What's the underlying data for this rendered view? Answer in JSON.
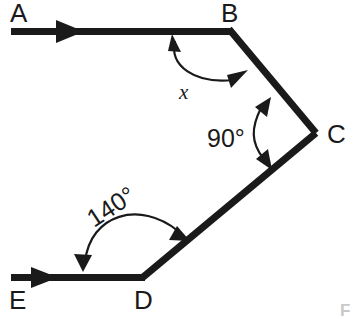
{
  "diagram": {
    "type": "geometry-angle-diagram",
    "background_color": "#ffffff",
    "ink_color": "#1a1a1a",
    "vertices": [
      {
        "id": "A",
        "label": "A",
        "x": 11,
        "y": 31,
        "label_x": 10,
        "label_y": 22
      },
      {
        "id": "B",
        "label": "B",
        "x": 230,
        "y": 31,
        "label_x": 222,
        "label_y": 22
      },
      {
        "id": "C",
        "label": "C",
        "x": 315,
        "y": 133,
        "label_x": 327,
        "label_y": 143
      },
      {
        "id": "D",
        "label": "D",
        "x": 143,
        "y": 277,
        "label_x": 134,
        "label_y": 307
      },
      {
        "id": "E",
        "label": "E",
        "x": 11,
        "y": 277,
        "label_x": 10,
        "label_y": 307
      }
    ],
    "segments": [
      {
        "name": "ray-AB",
        "from": "A",
        "to": "B"
      },
      {
        "name": "segment-BC",
        "from": "B",
        "to": "C"
      },
      {
        "name": "segment-CD",
        "from": "C",
        "to": "D"
      },
      {
        "name": "ray-ED",
        "from": "E",
        "to": "D"
      }
    ],
    "direction_arrows": [
      {
        "name": "arrow-on-AB",
        "x": 72,
        "y": 31,
        "direction": "right"
      },
      {
        "name": "arrow-on-ED",
        "x": 46,
        "y": 277,
        "direction": "right"
      }
    ],
    "angles": [
      {
        "id": "angle-x",
        "label": "x",
        "vertex": "B",
        "label_x": 180,
        "label_y": 98,
        "value_known": false,
        "arc_double_headed": true
      },
      {
        "id": "angle-90",
        "label": "90°",
        "vertex": "C",
        "label_x": 209,
        "label_y": 147,
        "value_known": true,
        "value": 90,
        "arc_double_headed": true
      },
      {
        "id": "angle-140",
        "label": "140°",
        "vertex": "D",
        "label_x": 94,
        "label_y": 228,
        "label_rotation": -33,
        "value_known": true,
        "value": 140,
        "arc_double_headed": true
      }
    ],
    "corner_mark": {
      "label": "F",
      "x": 341,
      "y": 315
    }
  }
}
